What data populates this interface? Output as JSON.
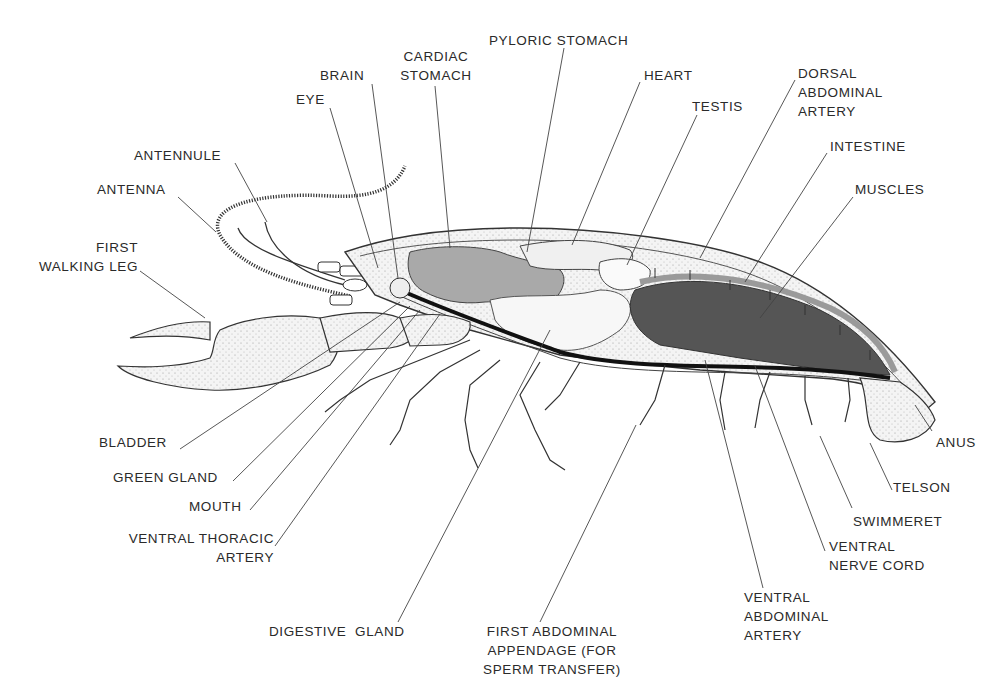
{
  "figure": {
    "colors": {
      "background": "#ffffff",
      "ink": "#2a2a2a",
      "organ_light": "#e4e4e4",
      "organ_mid": "#a9a9a9",
      "muscle_dark": "#555555",
      "nerve_black": "#111111",
      "stipple": "#cfcfcf"
    }
  },
  "labels": {
    "pyloric_stomach": "PYLORIC STOMACH",
    "cardiac_stomach": "CARDIAC\nSTOMACH",
    "brain": "BRAIN",
    "heart": "HEART",
    "eye": "EYE",
    "testis": "TESTIS",
    "dorsal_abdominal_artery": "DORSAL\nABDOMINAL\nARTERY",
    "antennule": "ANTENNULE",
    "intestine": "INTESTINE",
    "antenna": "ANTENNA",
    "muscles": "MUSCLES",
    "first_walking_leg": "FIRST\nWALKING LEG",
    "bladder": "BLADDER",
    "green_gland": "GREEN GLAND",
    "mouth": "MOUTH",
    "ventral_thoracic_artery": "VENTRAL THORACIC\nARTERY",
    "digestive_gland": "DIGESTIVE  GLAND",
    "first_abdominal_appendage": "FIRST ABDOMINAL\nAPPENDAGE (FOR\nSPERM TRANSFER)",
    "ventral_abdominal_artery": "VENTRAL\nABDOMINAL\nARTERY",
    "ventral_nerve_cord": "VENTRAL\nNERVE CORD",
    "swimmeret": "SWIMMERET",
    "telson": "TELSON",
    "anus": "ANUS"
  }
}
